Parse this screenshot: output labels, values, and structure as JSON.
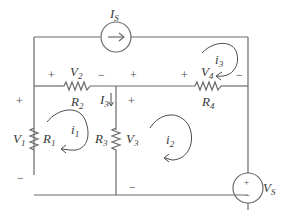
{
  "diagram": {
    "title": "",
    "sources": {
      "current_source": {
        "label": "I",
        "sub": "S"
      },
      "voltage_source": {
        "label": "V",
        "sub": "S",
        "plus": "+",
        "minus": "−"
      }
    },
    "resistors": {
      "R1": {
        "label": "R",
        "sub": "1",
        "voltage": "V",
        "vsub": "1"
      },
      "R2": {
        "label": "R",
        "sub": "2",
        "voltage": "V",
        "vsub": "2"
      },
      "R3": {
        "label": "R",
        "sub": "3",
        "voltage": "V",
        "vsub": "3"
      },
      "R4": {
        "label": "R",
        "sub": "4",
        "voltage": "V",
        "vsub": "4"
      }
    },
    "branch_current": {
      "label": "I",
      "sub": "3"
    },
    "mesh_currents": [
      {
        "label": "i",
        "sub": "1"
      },
      {
        "label": "i",
        "sub": "2"
      },
      {
        "label": "i",
        "sub": "3"
      }
    ],
    "signs": {
      "plus": "+",
      "minus": "−"
    }
  }
}
